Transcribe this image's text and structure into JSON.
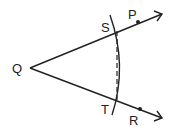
{
  "diagram": {
    "type": "geometry-angle-bisector-construction",
    "points": {
      "Q": {
        "label": "Q",
        "x": 30,
        "y": 68
      },
      "S": {
        "label": "S",
        "x": 117,
        "y": 31
      },
      "P": {
        "label": "P",
        "x": 138,
        "y": 22
      },
      "T": {
        "label": "T",
        "x": 117,
        "y": 101
      },
      "R": {
        "label": "R",
        "x": 140,
        "y": 109
      }
    },
    "rays": [
      {
        "name": "QP",
        "from": "Q",
        "through": "P"
      },
      {
        "name": "QR",
        "from": "Q",
        "through": "R"
      }
    ],
    "arc": {
      "center": "Q",
      "through": [
        "S",
        "T"
      ]
    },
    "dashed_segment": {
      "from": "S",
      "to": "T"
    },
    "colors": {
      "stroke": "#222222",
      "background": "#ffffff"
    }
  }
}
